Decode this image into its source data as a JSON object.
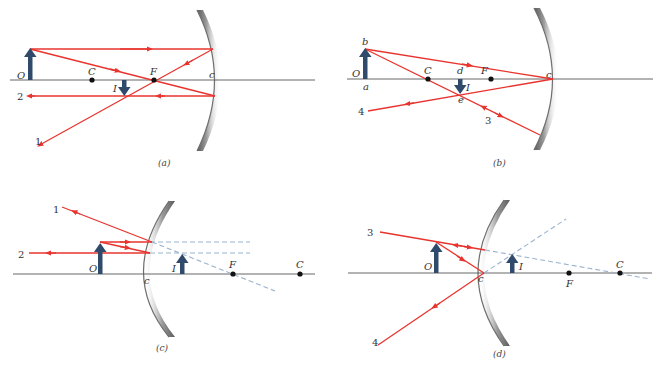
{
  "figure": {
    "colors": {
      "ray": "#e8342e",
      "arrow": "#2f4a6b",
      "virtual_ray": "#9ab3cf",
      "mirror": "#888888",
      "axis": "#555555"
    },
    "panels": [
      {
        "id": "a",
        "caption": "(a)",
        "mirror_type": "concave",
        "labels": {
          "object": "O",
          "center": "C",
          "focus": "F",
          "vertex": "c",
          "image": "I"
        },
        "ray_numbers": [
          "1",
          "2"
        ]
      },
      {
        "id": "b",
        "caption": "(b)",
        "mirror_type": "concave",
        "labels": {
          "object": "O",
          "object_top": "b",
          "object_base": "a",
          "center": "C",
          "image_base": "d",
          "focus": "F",
          "vertex": "c",
          "image": "I",
          "image_tip": "e"
        },
        "ray_numbers": [
          "3",
          "4"
        ]
      },
      {
        "id": "c",
        "caption": "(c)",
        "mirror_type": "convex",
        "labels": {
          "object": "O",
          "vertex": "c",
          "image": "I",
          "focus": "F",
          "center": "C"
        },
        "ray_numbers": [
          "1",
          "2"
        ]
      },
      {
        "id": "d",
        "caption": "(d)",
        "mirror_type": "convex",
        "labels": {
          "object": "O",
          "vertex": "c",
          "image": "I",
          "focus": "F",
          "center": "C"
        },
        "ray_numbers": [
          "3",
          "4"
        ]
      }
    ]
  }
}
